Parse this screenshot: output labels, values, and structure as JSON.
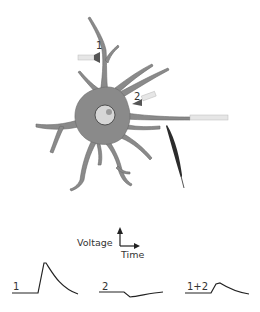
{
  "diagram": {
    "type": "neuron-synaptic-summation",
    "synapse_labels": [
      "1",
      "2"
    ],
    "axes": {
      "y_label": "Voltage",
      "x_label": "Time"
    },
    "traces": [
      {
        "label": "1",
        "shape": "large-depolarization"
      },
      {
        "label": "2",
        "shape": "small-hyperpolarization"
      },
      {
        "label": "1+2",
        "shape": "reduced-depolarization"
      }
    ],
    "elements": [
      "neuron-cell-body",
      "nucleus",
      "dendrites",
      "axon",
      "presynaptic-electrode-1",
      "presynaptic-electrode-2",
      "recording-electrode",
      "stimulating-electrode-axon"
    ]
  },
  "colors": {
    "neuron_fill": "#8a8a8a",
    "neuron_stroke": "#5a5a5a",
    "nucleus_fill": "#d6d6d6",
    "nucleolus_fill": "#9a9a9a",
    "electrode_glass": "#e6e6e6",
    "electrode_tip": "#2c2c2c",
    "trace_line": "#222222",
    "text": "#333333"
  }
}
